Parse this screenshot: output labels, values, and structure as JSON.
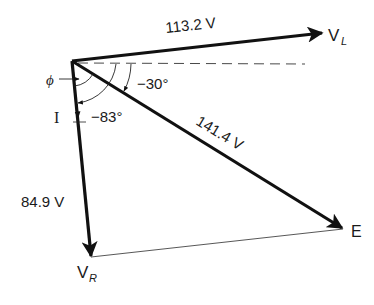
{
  "diagram": {
    "type": "phasor-diagram",
    "colors": {
      "line": "#111111",
      "background": "#ffffff",
      "text": "#1a1a1a"
    },
    "phasors": [
      {
        "id": "VL",
        "name": "V",
        "subscript": "L",
        "magnitude_label": "113.2 V"
      },
      {
        "id": "E",
        "name": "E",
        "subscript": "",
        "magnitude_label": "141.4 V"
      },
      {
        "id": "VR",
        "name": "V",
        "subscript": "R",
        "magnitude_label": "84.9 V"
      }
    ],
    "current": {
      "label": "I"
    },
    "angles": {
      "phi": "ϕ",
      "e_angle": "−30°",
      "i_angle": "−83°"
    }
  }
}
